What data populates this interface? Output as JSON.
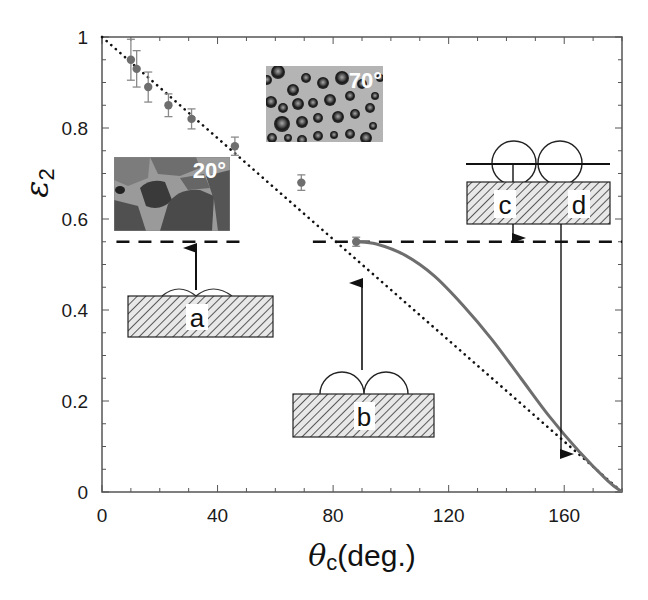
{
  "chart_data": {
    "type": "scatter",
    "title": "",
    "xlabel": "θc(deg.)",
    "xlabel_symbol": "θ",
    "xlabel_sub": "c",
    "xlabel_unit": "(deg.)",
    "ylabel": "ε2",
    "ylabel_symbol": "ε",
    "ylabel_sub": "2",
    "xlim": [
      0,
      180
    ],
    "ylim": [
      0,
      1
    ],
    "x_ticks": [
      0,
      40,
      80,
      120,
      160
    ],
    "x_tick_labels": [
      "0",
      "40",
      "80",
      "120",
      "160"
    ],
    "x_minor_step": 10,
    "y_ticks": [
      0,
      0.2,
      0.4,
      0.6,
      0.8,
      1
    ],
    "y_tick_labels": [
      "0",
      "0.2",
      "0.4",
      "0.6",
      "0.8",
      "1"
    ],
    "y_minor_step": 0.05,
    "grid": false,
    "legend": null,
    "series": [
      {
        "name": "measured",
        "type": "scatter_errorbar",
        "color": "#6e6e6e",
        "points": [
          {
            "x": 10,
            "y": 0.95,
            "err": 0.045
          },
          {
            "x": 12,
            "y": 0.93,
            "err": 0.04
          },
          {
            "x": 16,
            "y": 0.89,
            "err": 0.033
          },
          {
            "x": 23,
            "y": 0.85,
            "err": 0.025
          },
          {
            "x": 31,
            "y": 0.82,
            "err": 0.022
          },
          {
            "x": 46,
            "y": 0.76,
            "err": 0.02
          },
          {
            "x": 69,
            "y": 0.68,
            "err": 0.017
          },
          {
            "x": 88,
            "y": 0.55,
            "err": 0.01
          }
        ]
      },
      {
        "name": "linear (dotted)",
        "type": "line",
        "style": "dotted",
        "color": "#111111",
        "x": [
          0,
          180
        ],
        "y": [
          1,
          0
        ]
      },
      {
        "name": "model (solid)",
        "type": "line",
        "style": "solid",
        "color": "#6e6e6e",
        "x": [
          88,
          95,
          105,
          115,
          125,
          135,
          145,
          155,
          165,
          175,
          180
        ],
        "y": [
          0.55,
          0.545,
          0.52,
          0.475,
          0.41,
          0.335,
          0.25,
          0.165,
          0.09,
          0.025,
          0
        ]
      },
      {
        "name": "plateau (dashed)",
        "type": "hline",
        "style": "dashed",
        "color": "#111111",
        "y": 0.55,
        "segments": [
          [
            5,
            50
          ],
          [
            73,
            180
          ]
        ]
      }
    ],
    "annotations": [
      {
        "type": "photo",
        "label": "20°",
        "x_range": [
          4,
          44
        ],
        "y_range": [
          0.575,
          0.735
        ],
        "style": "grains"
      },
      {
        "type": "photo",
        "label": "70°",
        "x_range": [
          57,
          97
        ],
        "y_range": [
          0.77,
          0.935
        ],
        "style": "droplets"
      },
      {
        "type": "schematic",
        "label": "a",
        "x_range": [
          9,
          59
        ],
        "y_range": [
          0.34,
          0.43
        ],
        "arrow_to": {
          "x": 33,
          "y": 0.55
        }
      },
      {
        "type": "schematic",
        "label": "b",
        "x_range": [
          66,
          115
        ],
        "y_range": [
          0.12,
          0.215
        ],
        "arrow_to": {
          "x": 90,
          "y": 0.46
        }
      },
      {
        "type": "schematic",
        "label_left": "c",
        "label_right": "d",
        "x_range": [
          126,
          176
        ],
        "y_range": [
          0.59,
          0.68
        ]
      }
    ]
  },
  "figure": {
    "labels": {
      "a": "a",
      "b": "b",
      "c": "c",
      "d": "d",
      "photo_20": "20°",
      "photo_70": "70°"
    }
  }
}
